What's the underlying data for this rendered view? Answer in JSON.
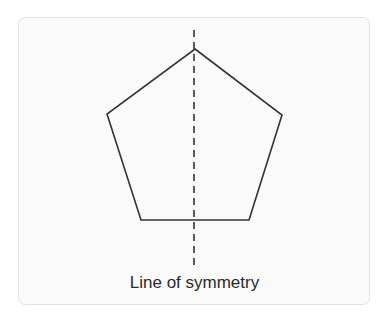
{
  "diagram": {
    "shape": "regular-pentagon",
    "caption": "Line of symmetry",
    "colors": {
      "page_background": "#ffffff",
      "card_background": "#fafafa",
      "card_border": "#e2e2e2",
      "stroke": "#333333",
      "text": "#2a2a2a"
    },
    "pentagon_points": "195,49 282,115 249,220 141,220 107,114",
    "symmetry_line": {
      "x": 194,
      "y1": 30,
      "y2": 268,
      "style": "dashed"
    }
  }
}
